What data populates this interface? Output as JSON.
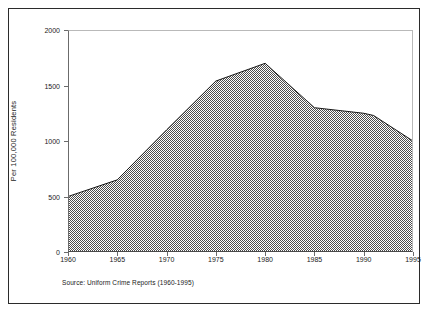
{
  "chart_data": {
    "type": "area",
    "title": "",
    "xlabel": "",
    "ylabel": "Per 100,000 Residents",
    "source_note": "Source:  Uniform Crime Reports (1960-1995)",
    "xlim": [
      1960,
      1995
    ],
    "ylim": [
      0,
      2000
    ],
    "grid": false,
    "legend": "none",
    "xticks": [
      1960,
      1965,
      1970,
      1975,
      1980,
      1985,
      1990,
      1995
    ],
    "xtick_labels": [
      "1960",
      "1965",
      "1970",
      "1975",
      "1980",
      "1985",
      "1990",
      "1995"
    ],
    "yticks": [
      0,
      500,
      1000,
      1500,
      2000
    ],
    "ytick_labels": [
      "0",
      "500",
      "1000",
      "1500",
      "2000"
    ],
    "x": [
      1960,
      1965,
      1970,
      1975,
      1980,
      1985,
      1990,
      1991,
      1995
    ],
    "values": [
      500,
      650,
      1100,
      1540,
      1700,
      1300,
      1250,
      1230,
      1000
    ],
    "series": [
      {
        "name": "Violent crime rate",
        "values": [
          500,
          650,
          1100,
          1540,
          1700,
          1300,
          1250,
          1230,
          1000
        ]
      }
    ],
    "fill_color": "#8c8c8c",
    "line_color": "#1a1a1a",
    "background_color": "#ffffff",
    "frame_color": "#2b2b2b"
  }
}
